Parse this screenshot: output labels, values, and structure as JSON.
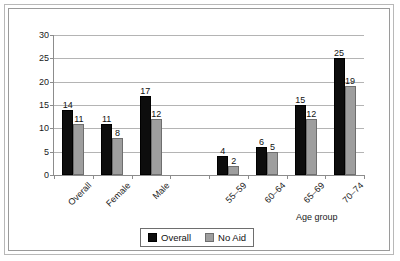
{
  "chart_data": {
    "type": "bar",
    "title": "",
    "xlabel": "Age group",
    "ylabel": "",
    "ylim": [
      0,
      30
    ],
    "yticks": [
      0,
      5,
      10,
      15,
      20,
      25,
      30
    ],
    "grid": true,
    "legend_position": "bottom-center",
    "categories": [
      "Overall",
      "Female",
      "Male",
      "",
      "55–59",
      "60–64",
      "65–69",
      "70–74"
    ],
    "category_slots": [
      {
        "label": "Overall",
        "has_bars": true
      },
      {
        "label": "Female",
        "has_bars": true
      },
      {
        "label": "Male",
        "has_bars": true
      },
      {
        "label": "",
        "has_bars": false
      },
      {
        "label": "55–59",
        "has_bars": true
      },
      {
        "label": "60–64",
        "has_bars": true
      },
      {
        "label": "65–69",
        "has_bars": true
      },
      {
        "label": "70–74",
        "has_bars": true
      }
    ],
    "series": [
      {
        "name": "Overall",
        "color": "#0d0d0d",
        "values": [
          14,
          11,
          17,
          null,
          4,
          6,
          15,
          25
        ]
      },
      {
        "name": "No Aid",
        "color": "#9e9e9e",
        "values": [
          11,
          8,
          12,
          null,
          2,
          5,
          12,
          19
        ]
      }
    ]
  },
  "legend": {
    "entries": [
      {
        "label": "Overall",
        "swatch": "black-square-swatch"
      },
      {
        "label": "No Aid",
        "swatch": "gray-square-swatch"
      }
    ]
  },
  "axis": {
    "x_title": "Age group"
  }
}
